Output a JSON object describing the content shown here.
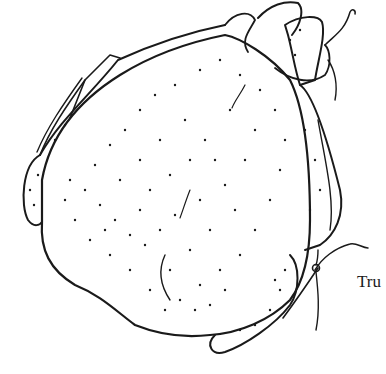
{
  "illustration": {
    "subject": "trussed poultry line drawing",
    "ink_color": "#1a1a1a",
    "background_color": "#ffffff"
  },
  "caption": {
    "text": "Tru"
  }
}
